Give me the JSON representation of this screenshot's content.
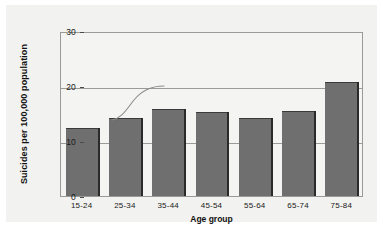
{
  "chart_data": {
    "type": "bar",
    "title": "",
    "xlabel": "Age group",
    "ylabel": "Suicides per 100,000 population",
    "categories": [
      "15-24",
      "25-34",
      "35-44",
      "45-54",
      "55-64",
      "65-74",
      "75-84"
    ],
    "values": [
      12.4,
      14.2,
      15.8,
      15.3,
      14.2,
      15.4,
      20.7
    ],
    "ylim": [
      0,
      30
    ],
    "yticks": [
      0,
      10,
      20,
      30
    ],
    "ytick_labels": [
      "0",
      "10",
      "20",
      "30"
    ],
    "grid": "horizontal",
    "legend": "none",
    "bar_color": "#6f6f6f",
    "frame_color": "#9a9a97",
    "background": "#f2f2f0",
    "annotations": [
      {
        "name": "hand-drawn-curve",
        "description": "faint pencil sigmoid curve rising from near the 25-34 bar top to the 20 gridline"
      }
    ]
  }
}
